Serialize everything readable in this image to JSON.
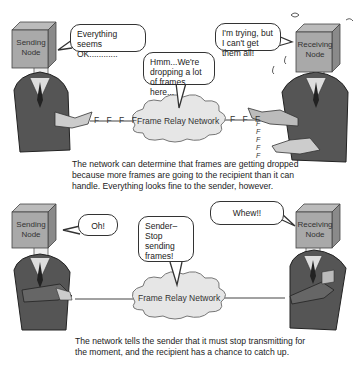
{
  "panels": [
    {
      "sender": {
        "label": "Sending Node",
        "speech": "Everything seems OK............"
      },
      "receiver": {
        "label": "Receiving Node",
        "speech": "I'm trying, but I can't get them all!"
      },
      "network": {
        "label": "Frame Relay Network",
        "speech": "Hmm...We're dropping a lot of frames here..."
      },
      "frames_in": "F F F F",
      "frames_out": "F F F",
      "frames_dropped": [
        "F",
        "F",
        "F",
        "F",
        "F"
      ],
      "caption": "The network can determine that frames are getting dropped because more frames are going to the recipient than it can handle. Everything looks fine to the sender, however."
    },
    {
      "sender": {
        "label": "Sending Node",
        "speech": "Oh!"
      },
      "receiver": {
        "label": "Receiving Node",
        "speech": "Whew!!"
      },
      "network": {
        "label": "Frame Relay Network",
        "speech": "Sender– Stop sending frames!"
      },
      "caption": "The network tells the sender that it must stop transmitting for the moment, and the recipient has a chance to catch up."
    }
  ]
}
